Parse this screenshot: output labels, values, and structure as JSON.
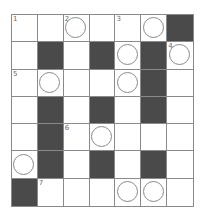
{
  "puzzle": {
    "rows": 7,
    "cols": 7,
    "colors": {
      "black": "#4a4a4a",
      "white": "#ffffff",
      "line": "#8a8a8a"
    },
    "cells": [
      [
        {
          "t": "w",
          "n": "1"
        },
        {
          "t": "w"
        },
        {
          "t": "c",
          "n": "2"
        },
        {
          "t": "w"
        },
        {
          "t": "w",
          "n": "3"
        },
        {
          "t": "c"
        },
        {
          "t": "b"
        }
      ],
      [
        {
          "t": "w"
        },
        {
          "t": "b"
        },
        {
          "t": "w"
        },
        {
          "t": "b"
        },
        {
          "t": "c"
        },
        {
          "t": "b"
        },
        {
          "t": "c",
          "n": "4"
        }
      ],
      [
        {
          "t": "w",
          "n": "5"
        },
        {
          "t": "c"
        },
        {
          "t": "w"
        },
        {
          "t": "w"
        },
        {
          "t": "c"
        },
        {
          "t": "b"
        },
        {
          "t": "w"
        }
      ],
      [
        {
          "t": "w"
        },
        {
          "t": "b"
        },
        {
          "t": "w"
        },
        {
          "t": "b"
        },
        {
          "t": "w"
        },
        {
          "t": "b"
        },
        {
          "t": "w"
        }
      ],
      [
        {
          "t": "w"
        },
        {
          "t": "b"
        },
        {
          "t": "w",
          "n": "6"
        },
        {
          "t": "c"
        },
        {
          "t": "w"
        },
        {
          "t": "w"
        },
        {
          "t": "w"
        }
      ],
      [
        {
          "t": "c"
        },
        {
          "t": "b"
        },
        {
          "t": "w"
        },
        {
          "t": "b"
        },
        {
          "t": "w"
        },
        {
          "t": "b"
        },
        {
          "t": "w"
        }
      ],
      [
        {
          "t": "b"
        },
        {
          "t": "w",
          "n": "7"
        },
        {
          "t": "w"
        },
        {
          "t": "w"
        },
        {
          "t": "c"
        },
        {
          "t": "c"
        },
        {
          "t": "w"
        }
      ]
    ]
  }
}
